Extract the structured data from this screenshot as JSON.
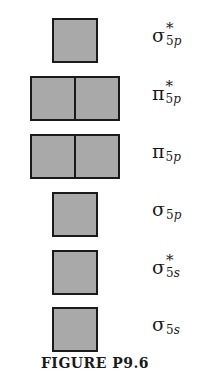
{
  "figure": {
    "caption": "FIGURE P9.6",
    "box_fill_color": "#a9a9a9",
    "box_border_color": "#1a1a1a",
    "levels": [
      {
        "name": "sigma-star-5p",
        "symbol": "σ",
        "star": "*",
        "sub_num": "5",
        "sub_orb": "p",
        "boxes": 1
      },
      {
        "name": "pi-star-5p",
        "symbol": "π",
        "star": "*",
        "sub_num": "5",
        "sub_orb": "p",
        "boxes": 2
      },
      {
        "name": "pi-5p",
        "symbol": "π",
        "star": "",
        "sub_num": "5",
        "sub_orb": "p",
        "boxes": 2
      },
      {
        "name": "sigma-5p",
        "symbol": "σ",
        "star": "",
        "sub_num": "5",
        "sub_orb": "p",
        "boxes": 1
      },
      {
        "name": "sigma-star-5s",
        "symbol": "σ",
        "star": "*",
        "sub_num": "5",
        "sub_orb": "s",
        "boxes": 1
      },
      {
        "name": "sigma-5s",
        "symbol": "σ",
        "star": "",
        "sub_num": "5",
        "sub_orb": "s",
        "boxes": 1
      }
    ]
  }
}
